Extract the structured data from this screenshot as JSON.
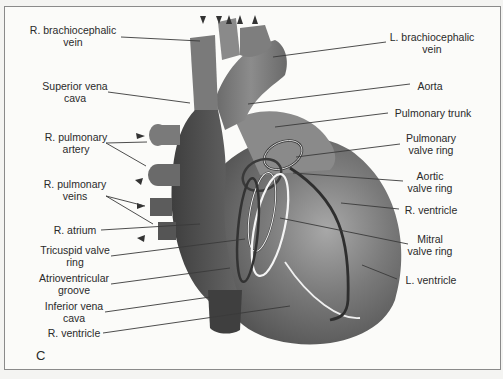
{
  "figure": {
    "panel_letter": "C",
    "labels_left": [
      {
        "id": "r-brachiocephalic-vein",
        "line1": "R. brachiocephalic",
        "line2": "vein"
      },
      {
        "id": "superior-vena-cava",
        "line1": "Superior vena",
        "line2": "cava"
      },
      {
        "id": "r-pulmonary-artery",
        "line1": "R. pulmonary",
        "line2": "artery"
      },
      {
        "id": "r-pulmonary-veins",
        "line1": "R. pulmonary",
        "line2": "veins"
      },
      {
        "id": "r-atrium",
        "line1": "R. atrium",
        "line2": ""
      },
      {
        "id": "tricuspid-valve-ring",
        "line1": "Tricuspid valve",
        "line2": "ring"
      },
      {
        "id": "atrioventricular-groove",
        "line1": "Atrioventricular",
        "line2": "groove"
      },
      {
        "id": "inferior-vena-cava",
        "line1": "Inferior vena",
        "line2": "cava"
      },
      {
        "id": "r-ventricle-left",
        "line1": "R. ventricle",
        "line2": ""
      }
    ],
    "labels_right": [
      {
        "id": "l-brachiocephalic-vein",
        "line1": "L. brachiocephalic",
        "line2": "vein"
      },
      {
        "id": "aorta",
        "line1": "Aorta",
        "line2": ""
      },
      {
        "id": "pulmonary-trunk",
        "line1": "Pulmonary trunk",
        "line2": ""
      },
      {
        "id": "pulmonary-valve-ring",
        "line1": "Pulmonary",
        "line2": "valve ring"
      },
      {
        "id": "aortic-valve-ring",
        "line1": "Aortic",
        "line2": "valve ring"
      },
      {
        "id": "r-ventricle-right",
        "line1": "R. ventricle",
        "line2": ""
      },
      {
        "id": "mitral-valve-ring",
        "line1": "Mitral",
        "line2": "valve ring"
      },
      {
        "id": "l-ventricle",
        "line1": "L. ventricle",
        "line2": ""
      }
    ],
    "colors": {
      "heart_dark": "#4a4a4a",
      "heart_mid": "#6e6e6e",
      "heart_light": "#9a9a9a",
      "leader_line": "#3a3a3a",
      "text": "#2a2a2a"
    }
  }
}
